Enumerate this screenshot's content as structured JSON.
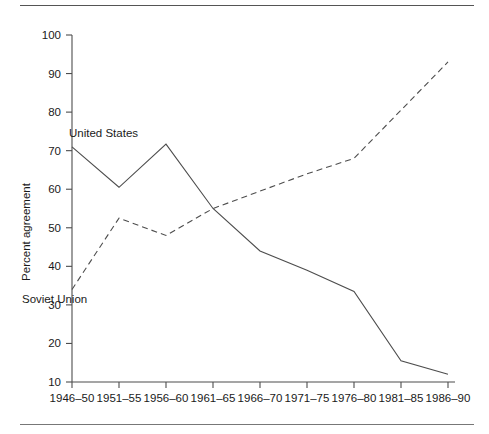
{
  "figure": {
    "has_top_rule": true,
    "has_bottom_rule": true,
    "background_color": "#ffffff",
    "axis_color": "#4d4d4d",
    "line_color": "#4d4d4d"
  },
  "chart_data": {
    "type": "line",
    "title": "",
    "subtitle": "",
    "xlabel": "",
    "ylabel": "Percent agreement",
    "categories": [
      "1946–50",
      "1951–55",
      "1956–60",
      "1961–65",
      "1966–70",
      "1971–75",
      "1976–80",
      "1981–85",
      "1986–90"
    ],
    "x_tick_labels": [
      "1946–50",
      "1951–55",
      "1956–60",
      "1961–65",
      "1966–70",
      "1971–75",
      "1976–80",
      "1981–85",
      "1986–90"
    ],
    "y_tick_labels": [
      "10",
      "20",
      "30",
      "40",
      "50",
      "60",
      "70",
      "80",
      "90",
      "100"
    ],
    "y_ticks": [
      10,
      20,
      30,
      40,
      50,
      60,
      70,
      80,
      90,
      100
    ],
    "ylim": [
      10,
      100
    ],
    "grid": false,
    "legend_position": "inline-annotation",
    "series": [
      {
        "name": "United States",
        "style": "solid",
        "label_text": "United States",
        "values": [
          71,
          60.5,
          71.7,
          55,
          44,
          39,
          33.5,
          15.5,
          12
        ]
      },
      {
        "name": "Soviet Union",
        "style": "dashed",
        "label_text": "Soviet Union",
        "values": [
          34,
          52.5,
          48,
          55,
          59.5,
          64,
          68,
          80.5,
          93
        ]
      }
    ],
    "annotations": [
      {
        "text": "United States",
        "x_category": "1951–55",
        "y": 74.5
      },
      {
        "text": "Soviet Union",
        "x_category": "1946–50",
        "y": 31.5
      }
    ]
  }
}
